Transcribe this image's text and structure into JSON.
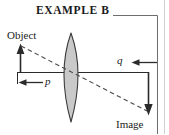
{
  "figure": {
    "title": "EXAMPLE B",
    "type": "optics-ray-diagram",
    "background_color": "#ffffff",
    "labels": {
      "object": "Object",
      "image": "Image",
      "object_distance": "p",
      "image_distance": "q"
    },
    "colors": {
      "stroke": "#2b2b2b",
      "lens_fill": "#c9c9c9",
      "lens_stroke": "#3a3a3a",
      "ray_dashed": "#4a4a4a",
      "frame_rule": "#6e6e6e",
      "frame_border": "#d2d2d2",
      "text": "#1a1a1a"
    },
    "elements": {
      "optical_axis": {
        "name": "optical-axis",
        "x1": 17,
        "y1": 72,
        "x2": 149,
        "y2": 72
      },
      "lens": {
        "name": "biconvex-lens",
        "center_x": 71,
        "top_y": 33,
        "bottom_y": 122,
        "half_width": 14,
        "fill": "#c9c9c9"
      },
      "object_arrow": {
        "name": "object-arrow",
        "x": 20,
        "base_y": 72,
        "tip_y": 45,
        "direction": "up"
      },
      "image_arrow": {
        "name": "image-arrow",
        "x": 148,
        "base_y": 72,
        "tip_y": 114,
        "direction": "down"
      },
      "principal_ray": {
        "name": "principal-ray-dashed",
        "x1": 21,
        "y1": 46,
        "x2": 148,
        "y2": 112,
        "style": "dashed"
      },
      "p_measure": {
        "name": "p-distance-arrow",
        "x_start": 17,
        "x_end": 71,
        "y": 82,
        "arrow_direction": "left"
      },
      "q_measure": {
        "name": "q-distance-arrow",
        "x_start": 131,
        "x_end": 158,
        "y": 62,
        "arrow_direction": "left"
      },
      "title_rule": {
        "name": "title-rule",
        "x1": 113,
        "y1": 15,
        "x2": 158,
        "y2": 15,
        "drop_to_y": 134
      },
      "frame_border_right": {
        "name": "frame-border-right",
        "x": 164,
        "y1": 0,
        "y2": 134
      }
    }
  }
}
